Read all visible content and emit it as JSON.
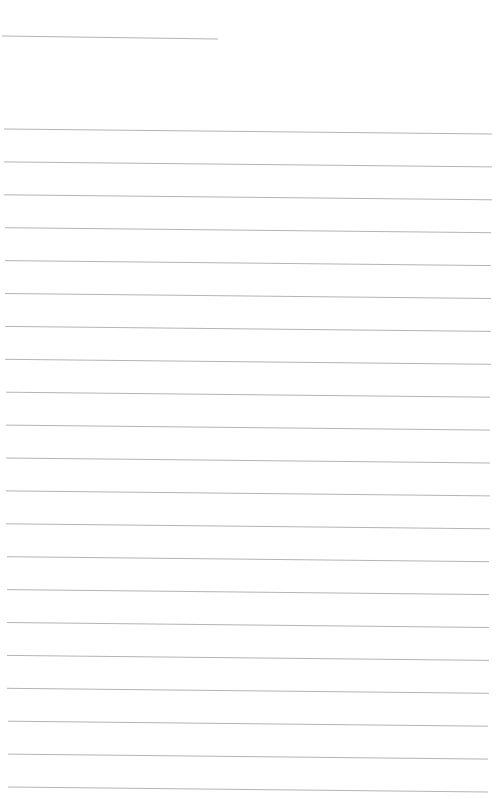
{
  "page": {
    "type": "blank lined paper",
    "background_color": "#ffffff",
    "line_color": "#b4b4b4"
  },
  "header_line": {
    "x1": 2,
    "y1": 36,
    "x2": 218,
    "y2": 39
  },
  "ruled_lines": {
    "count": 21,
    "first_y_left": 129,
    "spacing": 32.9,
    "x_left": 4,
    "x_right": 492,
    "slant": 5
  }
}
